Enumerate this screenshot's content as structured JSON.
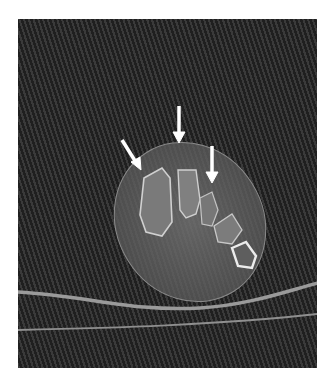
{
  "image": {
    "type": "CT axial slice",
    "subject": "foot cross-section",
    "arrows": [
      {
        "x1": 122,
        "y1": 140,
        "x2": 139,
        "y2": 168
      },
      {
        "x1": 179,
        "y1": 106,
        "x2": 179,
        "y2": 142
      },
      {
        "x1": 212,
        "y1": 146,
        "x2": 212,
        "y2": 182
      }
    ],
    "colors": {
      "background": "#2b2b2b",
      "soft_tissue": "#6a6a6a",
      "bone_cortex": "#d8d8d8",
      "arrow": "#ffffff",
      "table_line": "#9a9a9a"
    }
  }
}
